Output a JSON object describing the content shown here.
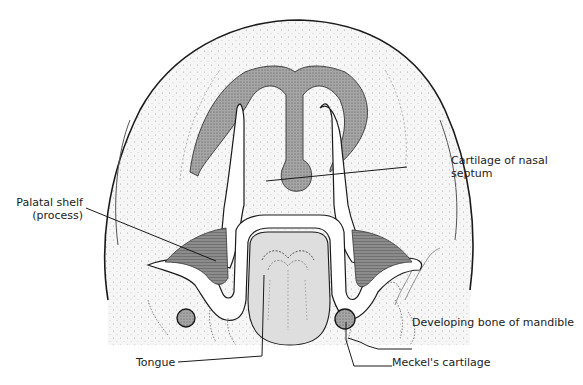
{
  "figure": {
    "labels": {
      "palatal_shelf_line1": "Palatal shelf",
      "palatal_shelf_line2": "(process)",
      "nasal_septum_line1": "Cartilage of nasal",
      "nasal_septum_line2": "septum",
      "mandible_bone": "Developing bone of mandible",
      "meckels": "Meckel's cartilage",
      "tongue": "Tongue"
    },
    "colors": {
      "outline": "#1a1a1a",
      "stipple_fill": "#f2f2f2",
      "dark_fill": "#8a8a8a",
      "cartilage_fill": "#9a9a9a",
      "tongue_fill": "#dcdcdc",
      "background": "#ffffff"
    }
  }
}
